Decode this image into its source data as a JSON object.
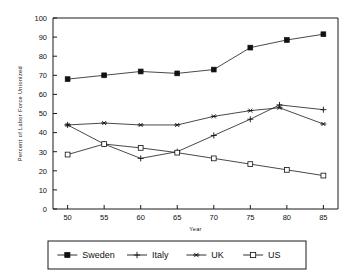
{
  "chart_data": {
    "type": "line",
    "title": "",
    "xlabel": "Year",
    "ylabel": "Percent of Labor Force Unionized",
    "xlim": [
      48,
      87
    ],
    "ylim": [
      0,
      100
    ],
    "grid": false,
    "legend_position": "bottom",
    "x_ticks": [
      "50",
      "55",
      "60",
      "65",
      "70",
      "75",
      "80",
      "85"
    ],
    "x_tick_values": [
      50,
      55,
      60,
      65,
      70,
      75,
      80,
      85
    ],
    "y_ticks": [
      "0",
      "10",
      "20",
      "30",
      "40",
      "50",
      "60",
      "70",
      "80",
      "90",
      "100"
    ],
    "y_tick_values": [
      0,
      10,
      20,
      30,
      40,
      50,
      60,
      70,
      80,
      90,
      100
    ],
    "series": [
      {
        "name": "Sweden",
        "marker": "filled-square",
        "x": [
          50,
          55,
          60,
          65,
          70,
          75,
          80,
          85
        ],
        "values": [
          68,
          70,
          72,
          71,
          73,
          84.5,
          88.5,
          91.5
        ]
      },
      {
        "name": "Italy",
        "marker": "plus",
        "x": [
          50,
          55,
          60,
          65,
          70,
          75,
          79,
          85
        ],
        "values": [
          44,
          34,
          26.5,
          30,
          38.5,
          47,
          54.5,
          52
        ]
      },
      {
        "name": "UK",
        "marker": "asterisk",
        "x": [
          50,
          55,
          60,
          65,
          70,
          75,
          79,
          85
        ],
        "values": [
          44,
          45,
          44,
          44,
          48.5,
          51.5,
          53,
          44.5
        ]
      },
      {
        "name": "US",
        "marker": "open-square",
        "x": [
          50,
          55,
          60,
          65,
          70,
          75,
          80,
          85
        ],
        "values": [
          28.5,
          34,
          32,
          29.5,
          26.5,
          23.5,
          20.5,
          17.5
        ]
      }
    ]
  },
  "legend": {
    "items": [
      {
        "label": "Sweden",
        "marker": "filled-square"
      },
      {
        "label": "Italy",
        "marker": "plus"
      },
      {
        "label": "UK",
        "marker": "asterisk"
      },
      {
        "label": "US",
        "marker": "open-square"
      }
    ]
  },
  "colors": {
    "ink": "#111111",
    "background": "#ffffff"
  }
}
